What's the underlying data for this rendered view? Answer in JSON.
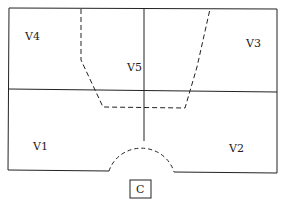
{
  "diagram": {
    "regions": [
      {
        "id": "V1",
        "label": "V1",
        "x": 30,
        "y": 148
      },
      {
        "id": "V2",
        "label": "V2",
        "x": 228,
        "y": 150
      },
      {
        "id": "V3",
        "label": "V3",
        "x": 246,
        "y": 45
      },
      {
        "id": "V4",
        "label": "V4",
        "x": 24,
        "y": 38
      },
      {
        "id": "V5",
        "label": "V5",
        "x": 128,
        "y": 70
      }
    ],
    "caption": "C",
    "line_color": "#222222"
  }
}
